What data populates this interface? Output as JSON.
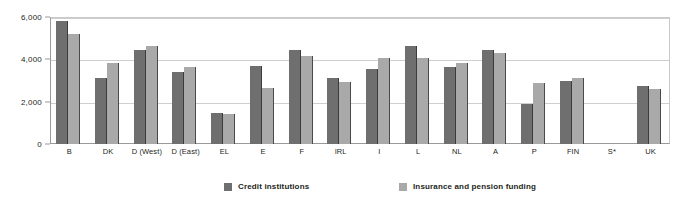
{
  "chart_data": {
    "type": "bar",
    "title": "",
    "subtitle": "",
    "xlabel": "",
    "ylabel": "",
    "ylim": [
      0,
      6000
    ],
    "yticks": [
      0,
      2000,
      4000,
      6000
    ],
    "ytick_labels": [
      "0",
      "2,000",
      "4,000",
      "6,000"
    ],
    "grid": true,
    "legend_position": "bottom",
    "categories": [
      "B",
      "DK",
      "D (West)",
      "D (East)",
      "EL",
      "E",
      "F",
      "IRL",
      "I",
      "L",
      "NL",
      "A",
      "P",
      "FIN",
      "S*",
      "UK"
    ],
    "series": [
      {
        "name": "Credit institutions",
        "color": "#6f6f6f",
        "values": [
          5800,
          3100,
          4450,
          3400,
          1450,
          3700,
          4450,
          3100,
          3550,
          4650,
          3650,
          4450,
          1900,
          3000,
          null,
          2750
        ]
      },
      {
        "name": "Insurance and pension funding",
        "color": "#a9a9a9",
        "values": [
          5200,
          3850,
          4650,
          3650,
          1400,
          2650,
          4150,
          2950,
          4050,
          4050,
          3850,
          4300,
          2900,
          3100,
          null,
          2600
        ]
      }
    ]
  }
}
